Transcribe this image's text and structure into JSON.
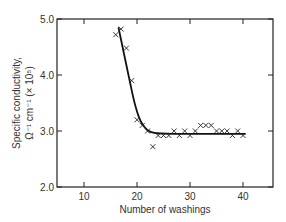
{
  "chart_data": {
    "type": "scatter",
    "title": "",
    "xlabel": "Number of washings",
    "ylabel_line1": "Specific conductivity,",
    "ylabel_line2": "Ω⁻¹ cm⁻¹ (× 10⁵)",
    "xlim": [
      5,
      45
    ],
    "ylim": [
      2.0,
      5.0
    ],
    "x_ticks": [
      "10",
      "20",
      "30",
      "40"
    ],
    "y_ticks": [
      "2.0",
      "3.0",
      "4.0",
      "5.0"
    ],
    "grid": false,
    "legend": "none",
    "series": [
      {
        "name": "Measurements",
        "marker": "x",
        "points": [
          [
            16,
            4.72
          ],
          [
            17,
            4.82
          ],
          [
            18,
            4.48
          ],
          [
            19,
            3.9
          ],
          [
            20,
            3.2
          ],
          [
            21,
            3.1
          ],
          [
            22,
            3.0
          ],
          [
            23,
            2.72
          ],
          [
            24,
            2.92
          ],
          [
            25,
            2.92
          ],
          [
            26,
            2.92
          ],
          [
            27,
            3.0
          ],
          [
            28,
            2.92
          ],
          [
            29,
            3.0
          ],
          [
            30,
            2.92
          ],
          [
            31,
            3.0
          ],
          [
            32,
            3.1
          ],
          [
            33,
            3.1
          ],
          [
            34,
            3.1
          ],
          [
            35,
            3.0
          ],
          [
            36,
            3.0
          ],
          [
            37,
            3.0
          ],
          [
            38,
            2.92
          ],
          [
            39,
            3.0
          ],
          [
            40,
            2.92
          ]
        ]
      },
      {
        "name": "Fitted curve",
        "type": "line",
        "points": [
          [
            16.5,
            4.85
          ],
          [
            17.5,
            4.4
          ],
          [
            18.5,
            3.95
          ],
          [
            19.5,
            3.5
          ],
          [
            20.5,
            3.2
          ],
          [
            21.5,
            3.05
          ],
          [
            22.5,
            2.98
          ],
          [
            24,
            2.95
          ],
          [
            30,
            2.95
          ],
          [
            40.5,
            2.95
          ]
        ]
      }
    ]
  }
}
